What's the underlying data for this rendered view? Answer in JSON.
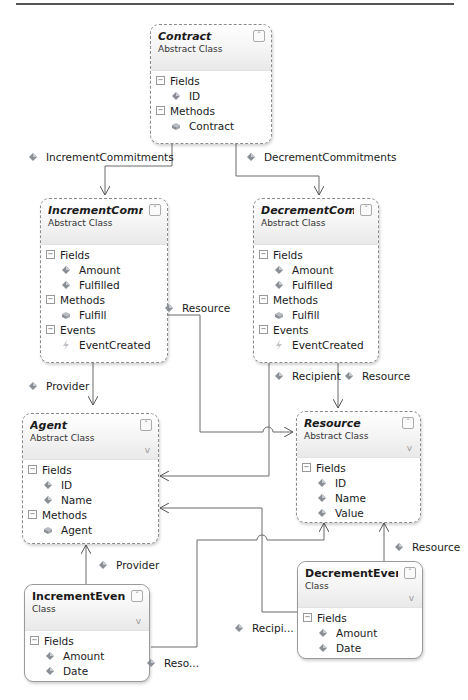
{
  "diagram": {
    "type": "class-diagram",
    "classes": [
      {
        "id": "contract",
        "name": "Contract",
        "stereotype": "Abstract Class",
        "abstract": true,
        "sections": [
          {
            "label": "Fields",
            "members": [
              {
                "name": "ID",
                "kind": "field"
              }
            ]
          },
          {
            "label": "Methods",
            "members": [
              {
                "name": "Contract",
                "kind": "method"
              }
            ]
          }
        ]
      },
      {
        "id": "increment-commitment",
        "name": "IncrementComm...",
        "stereotype": "Abstract Class",
        "abstract": true,
        "sections": [
          {
            "label": "Fields",
            "members": [
              {
                "name": "Amount",
                "kind": "field"
              },
              {
                "name": "Fulfilled",
                "kind": "field"
              }
            ]
          },
          {
            "label": "Methods",
            "members": [
              {
                "name": "Fulfill",
                "kind": "method"
              }
            ]
          },
          {
            "label": "Events",
            "members": [
              {
                "name": "EventCreated",
                "kind": "event"
              }
            ]
          }
        ]
      },
      {
        "id": "decrement-commitment",
        "name": "DecrementComm...",
        "stereotype": "Abstract Class",
        "abstract": true,
        "sections": [
          {
            "label": "Fields",
            "members": [
              {
                "name": "Amount",
                "kind": "field"
              },
              {
                "name": "Fulfilled",
                "kind": "field"
              }
            ]
          },
          {
            "label": "Methods",
            "members": [
              {
                "name": "Fulfill",
                "kind": "method"
              }
            ]
          },
          {
            "label": "Events",
            "members": [
              {
                "name": "EventCreated",
                "kind": "event"
              }
            ]
          }
        ]
      },
      {
        "id": "agent",
        "name": "Agent",
        "stereotype": "Abstract Class",
        "abstract": true,
        "sections": [
          {
            "label": "Fields",
            "members": [
              {
                "name": "ID",
                "kind": "field"
              },
              {
                "name": "Name",
                "kind": "field"
              }
            ]
          },
          {
            "label": "Methods",
            "members": [
              {
                "name": "Agent",
                "kind": "method"
              }
            ]
          }
        ]
      },
      {
        "id": "resource",
        "name": "Resource",
        "stereotype": "Abstract Class",
        "abstract": true,
        "sections": [
          {
            "label": "Fields",
            "members": [
              {
                "name": "ID",
                "kind": "field"
              },
              {
                "name": "Name",
                "kind": "field"
              },
              {
                "name": "Value",
                "kind": "field"
              }
            ]
          }
        ]
      },
      {
        "id": "increment-event",
        "name": "IncrementEvent",
        "stereotype": "Class",
        "abstract": false,
        "sections": [
          {
            "label": "Fields",
            "members": [
              {
                "name": "Amount",
                "kind": "field"
              },
              {
                "name": "Date",
                "kind": "field"
              }
            ]
          }
        ]
      },
      {
        "id": "decrement-event",
        "name": "DecrementEvent",
        "stereotype": "Class",
        "abstract": false,
        "sections": [
          {
            "label": "Fields",
            "members": [
              {
                "name": "Amount",
                "kind": "field"
              },
              {
                "name": "Date",
                "kind": "field"
              }
            ]
          }
        ]
      }
    ],
    "associations": [
      {
        "label": "IncrementCommitments",
        "from": "contract",
        "to": "increment-commitment"
      },
      {
        "label": "DecrementCommitments",
        "from": "contract",
        "to": "decrement-commitment"
      },
      {
        "label": "Resource",
        "from": "increment-commitment",
        "to": "resource"
      },
      {
        "label": "Provider",
        "from": "increment-commitment",
        "to": "agent"
      },
      {
        "label": "Recipient",
        "from": "decrement-commitment",
        "to": "agent"
      },
      {
        "label": "Resource",
        "from": "decrement-commitment",
        "to": "resource"
      },
      {
        "label": "Provider",
        "from": "increment-event",
        "to": "agent"
      },
      {
        "label": "Reso...",
        "from": "increment-event",
        "to": "resource"
      },
      {
        "label": "Recipi...",
        "from": "decrement-event",
        "to": "agent"
      },
      {
        "label": "Resource",
        "from": "decrement-event",
        "to": "resource"
      }
    ],
    "colors": {
      "border": "#8a8a8a",
      "line": "#6a6a6a",
      "header_gradient_end": "#e9e9e9"
    }
  }
}
